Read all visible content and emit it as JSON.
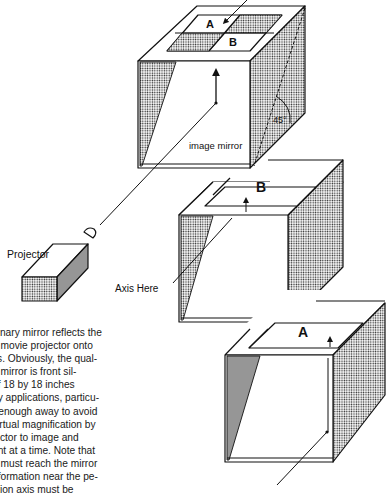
{
  "figure": {
    "labels": {
      "projector": "Projector",
      "image_mirror": "image mirror",
      "angle": "45°",
      "axis_here": "Axis Here",
      "quadrant_a": "A",
      "quadrant_b": "B",
      "middle_box_label": "B",
      "bottom_box_label": "A"
    },
    "colors": {
      "ink": "#111111",
      "paper": "#ffffff",
      "stipple": "#9a9a9a"
    }
  },
  "caption": {
    "lines": [
      "dinary mirror reflects the",
      "n movie projector onto",
      "ss. Obviously, the qual-",
      "e mirror is front sil-",
      "of 18 by 18 inches",
      "ny applications, particu-",
      "r enough away to avoid",
      "virtual magnification by",
      "jector to image and",
      "ant at a time. Note that",
      "n must reach the mirror",
      "eformation near the pe-",
      "ction axis must be"
    ]
  }
}
